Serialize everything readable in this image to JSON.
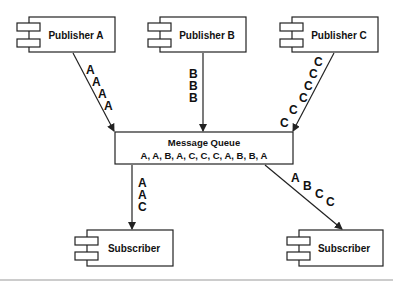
{
  "diagram": {
    "publishers": [
      {
        "label": "Publisher A",
        "messages": [
          "A",
          "A",
          "A",
          "A"
        ]
      },
      {
        "label": "Publisher B",
        "messages": [
          "B",
          "B",
          "B"
        ]
      },
      {
        "label": "Publisher C",
        "messages": [
          "C",
          "C",
          "C",
          "C",
          "C",
          "C"
        ]
      }
    ],
    "queue": {
      "title": "Message Queue",
      "contents": "A, A, B, A, C, C, C, A, B, B, A"
    },
    "subscribers": [
      {
        "label": "Subscriber",
        "messages": [
          "A",
          "A",
          "C"
        ]
      },
      {
        "label": "Subscriber",
        "messages": [
          "A",
          "B",
          "C",
          "C"
        ]
      }
    ],
    "colors": {
      "stroke": "#222222",
      "text": "#111111",
      "divider": "#999999",
      "background": "#ffffff"
    }
  }
}
